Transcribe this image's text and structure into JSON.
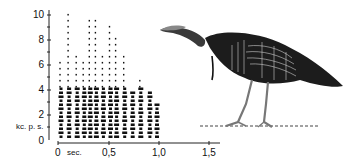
{
  "chart_data": {
    "type": "heatmap",
    "subtype": "sound-spectrogram",
    "title": "",
    "xlabel": "sec.",
    "ylabel": "kc. p. s.",
    "x_ticks": [
      "0",
      "0,5",
      "1,0",
      "1,5"
    ],
    "x_tick_values": [
      0,
      0.5,
      1.0,
      1.5
    ],
    "y_ticks": [
      "0",
      "2",
      "4",
      "6",
      "8",
      "10"
    ],
    "y_tick_values": [
      0,
      2,
      4,
      6,
      8,
      10
    ],
    "xlim": [
      0,
      1.6
    ],
    "ylim": [
      0,
      10
    ],
    "grid": false,
    "legend": null,
    "pulses": [
      {
        "t": 0.02,
        "fmax": 6.5
      },
      {
        "t": 0.1,
        "fmax": 10.0
      },
      {
        "t": 0.18,
        "fmax": 7.0
      },
      {
        "t": 0.25,
        "fmax": 6.5
      },
      {
        "t": 0.31,
        "fmax": 9.5
      },
      {
        "t": 0.37,
        "fmax": 9.5
      },
      {
        "t": 0.44,
        "fmax": 7.0
      },
      {
        "t": 0.51,
        "fmax": 9.3
      },
      {
        "t": 0.57,
        "fmax": 8.5
      },
      {
        "t": 0.65,
        "fmax": 7.0
      },
      {
        "t": 0.73,
        "fmax": 4.0
      },
      {
        "t": 0.81,
        "fmax": 4.7
      },
      {
        "t": 0.9,
        "fmax": 4.0
      },
      {
        "t": 0.97,
        "fmax": 3.0
      }
    ]
  },
  "illustration": {
    "subject": "wild turkey",
    "icon": "turkey-illustration"
  },
  "labels": {
    "y": [
      "10",
      "8",
      "6",
      "4",
      "2",
      "0"
    ],
    "unit": "kc. p. s.",
    "x": [
      "0",
      "0,5",
      "1,0",
      "1,5"
    ],
    "sec": "sec."
  }
}
